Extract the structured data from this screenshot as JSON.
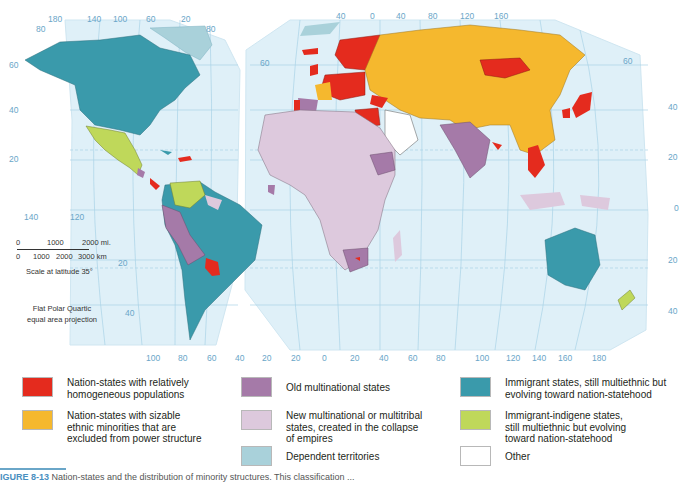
{
  "map": {
    "projection_note": [
      "Flat Polar Quartic",
      "equal area projection"
    ],
    "scale": {
      "miles_ticks": [
        "0",
        "1000",
        "2000 mi."
      ],
      "km_ticks": [
        "0",
        "1000",
        "2000",
        "3000 km"
      ],
      "caption": "Scale at latitude 35°"
    },
    "axis_labels": {
      "top_left_lobe": [
        "180",
        "140",
        "100",
        "60",
        "20"
      ],
      "top_right_lobe": [
        "40",
        "0",
        "40",
        "80",
        "120",
        "160"
      ],
      "left_lat": [
        "80",
        "60",
        "40",
        "20"
      ],
      "left_lobe_right_lat": [
        "80"
      ],
      "mid_lat": [
        "60",
        "20",
        "20",
        "40"
      ],
      "mid_lon": [
        "140",
        "120"
      ],
      "right_lat": [
        "60",
        "40",
        "20",
        "0",
        "20",
        "40"
      ],
      "bottom_left_lobe": [
        "100",
        "80",
        "60",
        "40",
        "20"
      ],
      "bottom_right_lobe": [
        "20",
        "0",
        "20",
        "40",
        "60",
        "80",
        "100",
        "120",
        "140",
        "160",
        "180"
      ]
    },
    "colors": {
      "ocean": "#dff0f8",
      "graticule": "#9fcbe2",
      "nation_homogeneous": "#e42b1e",
      "nation_minorities_excluded": "#f5b82e",
      "old_multinational": "#a57aa8",
      "new_multinational": "#ddc9dd",
      "dependent": "#a9d1da",
      "immigrant": "#3a9aab",
      "immigrant_indigene": "#bfd85a",
      "other": "#ffffff"
    }
  },
  "legend": {
    "items": [
      {
        "label": "Nation-states with relatively homogeneous populations",
        "color": "#e42b1e"
      },
      {
        "label": "Nation-states with sizable ethnic minorities that are excluded from power structure",
        "color": "#f5b82e"
      },
      {
        "label": "Old multinational states",
        "color": "#a57aa8"
      },
      {
        "label": "New multinational or multitribal states, created in the collapse of empires",
        "color": "#ddc9dd"
      },
      {
        "label": "Dependent territories",
        "color": "#a9d1da"
      },
      {
        "label": "Immigrant states, still multiethnic but evolving toward nation-statehood",
        "color": "#3a9aab"
      },
      {
        "label": "Immigrant-indigene states, still multiethnic but evolving toward nation-statehood",
        "color": "#bfd85a"
      },
      {
        "label": "Other",
        "color": "#ffffff"
      }
    ]
  },
  "caption": {
    "figure_number": "IGURE 8-13",
    "text": "Nation-states and the distribution of minority structures. This classification ..."
  }
}
